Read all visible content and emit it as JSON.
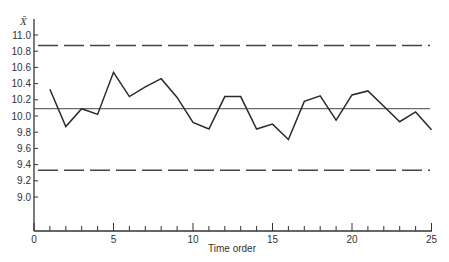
{
  "chart_data": {
    "type": "line",
    "title": "",
    "xlabel": "Time order",
    "ylabel": "X̄",
    "xlim": [
      0,
      25
    ],
    "ylim_ticks_range": [
      9.0,
      11.0
    ],
    "x_ticks_major": [
      0,
      5,
      10,
      15,
      20,
      25
    ],
    "x_ticks_minor_step": 1,
    "y_ticks": [
      9.0,
      9.2,
      9.4,
      9.6,
      9.8,
      10.0,
      10.2,
      10.4,
      10.6,
      10.8,
      11.0
    ],
    "y_tick_labels": [
      "9.0",
      "9.2",
      "9.4",
      "9.6",
      "9.8",
      "10.0",
      "10.2",
      "10.4",
      "10.6",
      "10.8",
      "11.0"
    ],
    "x_tick_labels": [
      "0",
      "5",
      "10",
      "15",
      "20",
      "25"
    ],
    "grid": false,
    "legend": null,
    "series": [
      {
        "name": "sample means",
        "x": [
          1,
          2,
          3,
          4,
          5,
          6,
          7,
          8,
          9,
          10,
          11,
          12,
          13,
          14,
          15,
          16,
          17,
          18,
          19,
          20,
          21,
          22,
          23,
          24,
          25
        ],
        "values": [
          10.33,
          9.87,
          10.09,
          10.02,
          10.54,
          10.24,
          10.36,
          10.46,
          10.23,
          9.92,
          9.84,
          10.24,
          10.24,
          9.84,
          9.9,
          9.71,
          10.18,
          10.25,
          9.95,
          10.26,
          10.31,
          10.12,
          9.93,
          10.05,
          9.83
        ]
      }
    ],
    "reference_lines": [
      {
        "name": "upper control limit",
        "value": 10.87,
        "style": "dashed"
      },
      {
        "name": "center line",
        "value": 10.09,
        "style": "solid"
      },
      {
        "name": "lower control limit",
        "value": 9.33,
        "style": "dashed"
      }
    ]
  },
  "labels": {
    "y_axis_symbol": "X̄",
    "x_axis_title": "Time order"
  }
}
